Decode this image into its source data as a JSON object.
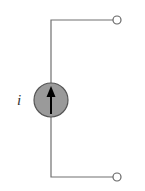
{
  "diagram": {
    "type": "circuit",
    "components": [
      {
        "kind": "current-source",
        "label": "i",
        "direction": "up",
        "fill_color": "#9a9a9a",
        "stroke_color": "#555555"
      }
    ],
    "terminals": [
      {
        "name": "top-terminal",
        "state": "open"
      },
      {
        "name": "bottom-terminal",
        "state": "open"
      }
    ],
    "wire_color": "#707070",
    "arrow_color": "#000000"
  }
}
